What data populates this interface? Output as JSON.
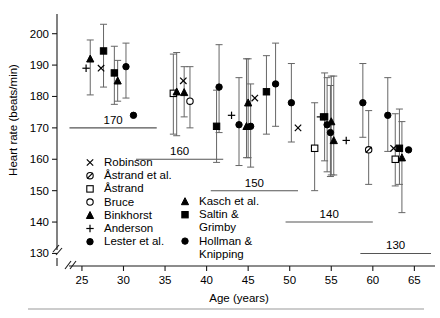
{
  "chart_data": {
    "type": "scatter",
    "title": "",
    "xlabel": "Age (years)",
    "ylabel": "Heart rate (beats/min)",
    "xlim": [
      22,
      67
    ],
    "ylim": [
      126,
      205
    ],
    "xticks": [
      25,
      30,
      35,
      40,
      45,
      50,
      55,
      60,
      65
    ],
    "yticks": [
      130,
      140,
      150,
      160,
      170,
      180,
      190,
      200
    ],
    "grid": false,
    "legend_position": "inside-lower-left",
    "axis_break_x": true,
    "reference_lines": [
      {
        "label": "170",
        "value": 170,
        "x_start": 23.5,
        "x_end": 34.0
      },
      {
        "label": "160",
        "value": 160,
        "x_start": 31.5,
        "x_end": 42.0
      },
      {
        "label": "150",
        "value": 150,
        "x_start": 40.5,
        "x_end": 51.0
      },
      {
        "label": "140",
        "value": 140,
        "x_start": 49.5,
        "x_end": 60.0
      },
      {
        "label": "130",
        "value": 130,
        "x_start": 58.5,
        "x_end": 67.0
      }
    ],
    "series": [
      {
        "name": "Robinson",
        "marker": "x",
        "points": [
          {
            "x": 27.3,
            "y": 189.0
          },
          {
            "x": 37.2,
            "y": 185.0
          },
          {
            "x": 45.8,
            "y": 179.5
          },
          {
            "x": 51.0,
            "y": 170.0
          },
          {
            "x": 62.5,
            "y": 163.5
          }
        ]
      },
      {
        "name": "Astrand et al.",
        "marker": "slashed-circle",
        "points": [
          {
            "x": 59.5,
            "y": 163.0,
            "lo": 152.0,
            "hi": 175.5
          }
        ]
      },
      {
        "name": "Astrand",
        "marker": "open-square",
        "points": [
          {
            "x": 36.0,
            "y": 181.0,
            "lo": 168.0,
            "hi": 193.5
          },
          {
            "x": 53.0,
            "y": 163.5,
            "lo": 150.0,
            "hi": 178.0
          },
          {
            "x": 62.7,
            "y": 160.0,
            "lo": 151.5,
            "hi": 174.5
          }
        ]
      },
      {
        "name": "Bruce",
        "marker": "open-circle",
        "points": [
          {
            "x": 38.0,
            "y": 178.5,
            "lo": 170.0,
            "hi": 189.5
          }
        ]
      },
      {
        "name": "Binkhorst",
        "marker": "triangle",
        "points": [
          {
            "x": 26.0,
            "y": 192.0,
            "lo": 180.5,
            "hi": 198.0
          },
          {
            "x": 29.3,
            "y": 185.0,
            "lo": 178.5,
            "hi": 191.5
          },
          {
            "x": 36.4,
            "y": 181.5,
            "lo": 167.5,
            "hi": 194.0
          },
          {
            "x": 37.3,
            "y": 181.3,
            "lo": 173.5,
            "hi": 189.5
          },
          {
            "x": 45.0,
            "y": 178.0,
            "lo": 160.5,
            "hi": 192.0
          },
          {
            "x": 44.8,
            "y": 170.5,
            "lo": 160.5,
            "hi": 192.0
          },
          {
            "x": 55.0,
            "y": 172.0,
            "lo": 155.0,
            "hi": 186.5
          },
          {
            "x": 55.3,
            "y": 166.0,
            "lo": 155.0,
            "hi": 186.5
          },
          {
            "x": 63.5,
            "y": 160.5,
            "lo": 143.0,
            "hi": 172.0
          }
        ]
      },
      {
        "name": "Anderson",
        "marker": "plus",
        "points": [
          {
            "x": 25.5,
            "y": 189.0
          },
          {
            "x": 43.0,
            "y": 174.0
          },
          {
            "x": 53.7,
            "y": 173.5
          },
          {
            "x": 56.8,
            "y": 166.0
          }
        ]
      },
      {
        "name": "Lester et al.",
        "marker": "circle",
        "points": [
          {
            "x": 30.3,
            "y": 189.5,
            "lo": 179.5,
            "hi": 197.0
          },
          {
            "x": 31.2,
            "y": 174.0
          },
          {
            "x": 41.5,
            "y": 183.0,
            "lo": 168.5,
            "hi": 196.5
          },
          {
            "x": 43.9,
            "y": 171.0,
            "lo": 158.0,
            "hi": 186.0
          },
          {
            "x": 45.3,
            "y": 170.5,
            "lo": 157.5,
            "hi": 184.0
          },
          {
            "x": 48.3,
            "y": 184.0,
            "lo": 170.5,
            "hi": 197.0
          },
          {
            "x": 50.2,
            "y": 178.0,
            "lo": 165.5,
            "hi": 190.5
          },
          {
            "x": 54.5,
            "y": 171.0,
            "lo": 156.0,
            "hi": 186.0
          },
          {
            "x": 54.9,
            "y": 168.5,
            "lo": 154.5,
            "hi": 183.5
          },
          {
            "x": 58.8,
            "y": 178.0,
            "lo": 167.0,
            "hi": 190.5
          },
          {
            "x": 61.8,
            "y": 174.0,
            "lo": 162.5,
            "hi": 186.0
          },
          {
            "x": 64.3,
            "y": 163.0
          }
        ]
      },
      {
        "name": "Kasch et al.",
        "marker": "triangle",
        "points": []
      },
      {
        "name": "Saltin & Grimby",
        "marker": "square",
        "points": [
          {
            "x": 27.6,
            "y": 194.5,
            "lo": 183.0,
            "hi": 203.0
          },
          {
            "x": 28.9,
            "y": 187.5,
            "lo": 177.5,
            "hi": 196.0
          },
          {
            "x": 41.2,
            "y": 170.5,
            "lo": 159.0,
            "hi": 182.0
          },
          {
            "x": 47.2,
            "y": 181.5,
            "lo": 168.0,
            "hi": 193.0
          },
          {
            "x": 54.2,
            "y": 173.5,
            "lo": 159.5,
            "hi": 187.5
          },
          {
            "x": 63.2,
            "y": 163.5,
            "lo": 152.0,
            "hi": 176.0
          }
        ]
      },
      {
        "name": "Hollman & Knipping",
        "marker": "circle",
        "points": []
      }
    ]
  },
  "legend": {
    "column1": [
      {
        "symbol": "x",
        "label": "Robinson"
      },
      {
        "symbol": "slashed-circle",
        "label": "Åstrand et al."
      },
      {
        "symbol": "open-square",
        "label": "Åstrand"
      },
      {
        "symbol": "open-circle",
        "label": "Bruce"
      },
      {
        "symbol": "triangle",
        "label": "Binkhorst"
      },
      {
        "symbol": "plus",
        "label": "Anderson"
      },
      {
        "symbol": "circle",
        "label": "Lester et al."
      }
    ],
    "column2": [
      {
        "symbol": "triangle",
        "label": "Kasch et al."
      },
      {
        "symbol": "square",
        "label": "Saltin &"
      },
      {
        "symbol": "none",
        "label": "Grimby"
      },
      {
        "symbol": "circle",
        "label": "Hollman &"
      },
      {
        "symbol": "none",
        "label": "Knipping"
      }
    ]
  },
  "colors": {
    "marker": "#000000",
    "axis": "#1a1a1a",
    "errorbar": "#666666",
    "refline": "#555555",
    "background": "#ffffff"
  }
}
